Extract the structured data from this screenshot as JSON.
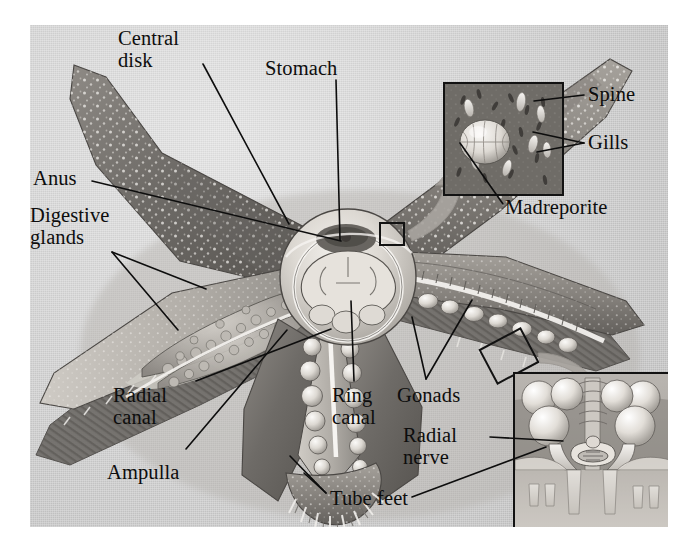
{
  "figure": {
    "background_color": "#ffffff",
    "plate_color": "#cfcfcf",
    "ink_color": "#0d0d0d",
    "style": "grayscale airbrush biological illustration"
  },
  "labels": [
    {
      "id": "central-disk",
      "text": "Central\ndisk",
      "x": 118,
      "y": 28,
      "align": "left"
    },
    {
      "id": "stomach",
      "text": "Stomach",
      "x": 265,
      "y": 58,
      "align": "left"
    },
    {
      "id": "spine",
      "text": "Spine",
      "x": 588,
      "y": 84,
      "align": "left"
    },
    {
      "id": "gills",
      "text": "Gills",
      "x": 588,
      "y": 132,
      "align": "left"
    },
    {
      "id": "anus",
      "text": "Anus",
      "x": 33,
      "y": 168,
      "align": "left"
    },
    {
      "id": "madreporite",
      "text": "Madreporite",
      "x": 505,
      "y": 197,
      "align": "left"
    },
    {
      "id": "digestive-glands",
      "text": "Digestive\nglands",
      "x": 30,
      "y": 205,
      "align": "left"
    },
    {
      "id": "radial-canal",
      "text": "Radial\ncanal",
      "x": 113,
      "y": 385,
      "align": "left"
    },
    {
      "id": "ring-canal",
      "text": "Ring\ncanal",
      "x": 332,
      "y": 385,
      "align": "left"
    },
    {
      "id": "gonads",
      "text": "Gonads",
      "x": 397,
      "y": 385,
      "align": "left"
    },
    {
      "id": "radial-nerve",
      "text": "Radial\nnerve",
      "x": 403,
      "y": 425,
      "align": "left"
    },
    {
      "id": "ampulla",
      "text": "Ampulla",
      "x": 107,
      "y": 462,
      "align": "left"
    },
    {
      "id": "tube-feet",
      "text": "Tube feet",
      "x": 330,
      "y": 488,
      "align": "left"
    }
  ],
  "insets": [
    {
      "id": "aboral-surface-detail",
      "caption": "Aboral surface magnified: madreporite, spines and gills",
      "x": 443,
      "y": 82,
      "width": 117,
      "height": 110,
      "contents": [
        "madreporite",
        "spine",
        "gills"
      ]
    },
    {
      "id": "arm-cross-section-detail",
      "caption": "Arm cross section: ampullae, radial nerve and tube feet",
      "x": 513,
      "y": 372,
      "width": 155,
      "height": 155,
      "contents": [
        "ampulla",
        "radial-nerve",
        "tube-feet"
      ]
    }
  ],
  "callout_boxes": [
    {
      "id": "madreporite-callout-box",
      "x": 350,
      "y": 198,
      "width": 24,
      "height": 22,
      "rotation": 0
    },
    {
      "id": "arm-callout-box",
      "x": 456,
      "y": 312,
      "width": 46,
      "height": 38,
      "rotation": -28
    }
  ],
  "structures": [
    "central disk",
    "stomach",
    "anus",
    "digestive glands",
    "madreporite",
    "spine",
    "gills",
    "gonads",
    "ring canal",
    "radial canal",
    "ampulla",
    "tube feet",
    "radial nerve"
  ],
  "arm_count": 5
}
